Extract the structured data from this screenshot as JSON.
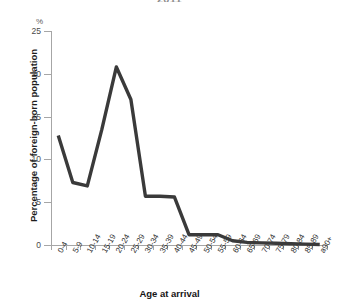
{
  "chart_data": {
    "type": "line",
    "title": "2011",
    "xlabel": "Age at arrival",
    "ylabel": "Percentage of foreign-born population",
    "unit_label": "%",
    "ylim": [
      0,
      25
    ],
    "yticks": [
      0,
      5,
      10,
      15,
      20,
      25
    ],
    "ytick_labels": [
      "0",
      "5",
      "10",
      "15",
      "20",
      "25"
    ],
    "grid": false,
    "legend": "none",
    "line_color": "#3a3a3a",
    "categories": [
      "0-4",
      "5-9",
      "10-14",
      "15-19",
      "20-24",
      "25-29",
      "30-34",
      "35-39",
      "40-44",
      "45-49",
      "50-54",
      "55-59",
      "60-64",
      "65-69",
      "70-74",
      "75-79",
      "80-84",
      "85-89",
      "a90+"
    ],
    "values": [
      12.8,
      7.3,
      6.9,
      13.5,
      20.8,
      17.0,
      5.7,
      5.7,
      5.6,
      1.2,
      1.2,
      1.2,
      0.5,
      0.3,
      0.25,
      0.2,
      0.15,
      0.1,
      0.05
    ],
    "series": [
      {
        "name": "Percentage of foreign-born population",
        "values": [
          12.8,
          7.3,
          6.9,
          13.5,
          20.8,
          17.0,
          5.7,
          5.7,
          5.6,
          1.2,
          1.2,
          1.2,
          0.5,
          0.3,
          0.25,
          0.2,
          0.15,
          0.1,
          0.05
        ]
      }
    ]
  }
}
